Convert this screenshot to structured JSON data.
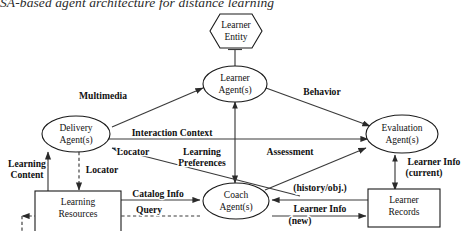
{
  "caption": "SA-based agent architecture for distance learning",
  "colors": {
    "background": "#ffffff",
    "stroke": "#1a1a1a",
    "line": "#3a3a3a",
    "text": "#111111"
  },
  "nodes": {
    "learner_entity": {
      "label_line1": "Learner",
      "label_line2": "Entity",
      "shape": "hexagon"
    },
    "learner_agent": {
      "label_line1": "Learner",
      "label_line2": "Agent(s)",
      "shape": "ellipse"
    },
    "delivery_agent": {
      "label_line1": "Delivery",
      "label_line2": "Agent(s)",
      "shape": "ellipse"
    },
    "evaluation_agent": {
      "label_line1": "Evaluation",
      "label_line2": "Agent(s)",
      "shape": "ellipse"
    },
    "coach_agent": {
      "label_line1": "Coach",
      "label_line2": "Agent(s)",
      "shape": "ellipse"
    },
    "learning_resources": {
      "label_line1": "Learning",
      "label_line2": "Resources",
      "shape": "rectangle"
    },
    "learner_records": {
      "label_line1": "Learner",
      "label_line2": "Records",
      "shape": "rectangle"
    }
  },
  "edge_labels": {
    "multimedia": "Multimedia",
    "behavior": "Behavior",
    "interaction_context": "Interaction Context",
    "locator_upper": "Locator",
    "locator_lower": "Locator",
    "learning_preferences_l1": "Learning",
    "learning_preferences_l2": "Preferences",
    "assessment": "Assessment",
    "learning_content_l1": "Learning",
    "learning_content_l2": "Content",
    "learner_info_current_l1": "Learner Info",
    "learner_info_current_l2": "(current)",
    "catalog_info": "Catalog Info",
    "query": "Query",
    "history_obj": "(history/obj.)",
    "learner_info_new_l1": "Learner Info",
    "learner_info_new_l2": "(new)"
  }
}
